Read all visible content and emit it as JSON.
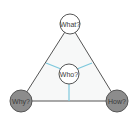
{
  "diagram": {
    "nodes": [
      {
        "id": "what",
        "label": "What?",
        "cx": 70,
        "cy": 24,
        "r": 10,
        "fill": "#ffffff"
      },
      {
        "id": "who",
        "label": "Who?",
        "cx": 69,
        "cy": 74,
        "r": 10,
        "fill": "#ffffff"
      },
      {
        "id": "why",
        "label": "Why?",
        "cx": 21,
        "cy": 101,
        "r": 11,
        "fill": "#8c8c8c"
      },
      {
        "id": "how",
        "label": "How?",
        "cx": 117,
        "cy": 101,
        "r": 11,
        "fill": "#8c8c8c"
      }
    ],
    "colors": {
      "edge": "#555555",
      "connector": "#7ec8dc",
      "triangle_fill": "#f7f8f8"
    }
  }
}
